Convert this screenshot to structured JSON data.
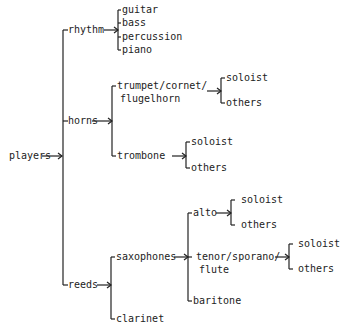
{
  "diagram": {
    "root": "players",
    "level1": {
      "rhythm": "rhythm",
      "horns": "horns",
      "reeds": "reeds"
    },
    "rhythm_children": [
      "guitar",
      "bass",
      "percussion",
      "piano"
    ],
    "horns_children": {
      "trumpet_line1": "trumpet/cornet/",
      "trumpet_line2": "flugelhorn",
      "trombone": "trombone"
    },
    "reeds_children": {
      "saxophones": "saxophones",
      "clarinet": "clarinet"
    },
    "sax_children": {
      "alto": "alto",
      "tenor_line1": "tenor/sporano/",
      "tenor_line2": "flute",
      "baritone": "baritone"
    },
    "leaf": {
      "soloist": "soloist",
      "others": "others"
    }
  }
}
